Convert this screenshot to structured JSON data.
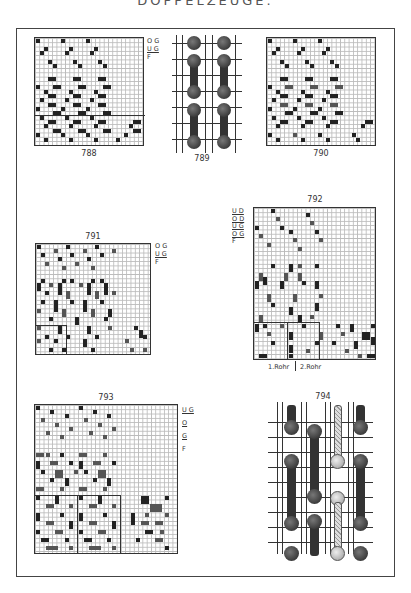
{
  "page": {
    "header": "DOPPELZEUGE."
  },
  "figures": [
    {
      "id": "788",
      "label": "788",
      "type": "weave-draft",
      "legend": [
        "O G",
        "U G",
        "F"
      ]
    },
    {
      "id": "789",
      "label": "789",
      "type": "interlacing-diagram"
    },
    {
      "id": "790",
      "label": "790",
      "type": "weave-draft"
    },
    {
      "id": "791",
      "label": "791",
      "type": "weave-draft",
      "legend": [
        "O G",
        "U G",
        "F"
      ]
    },
    {
      "id": "792",
      "label": "792",
      "type": "weave-draft",
      "legend": [
        "U D",
        "O D",
        "U G",
        "O G",
        "F"
      ],
      "footer": [
        "1.Rohr",
        "2.Rohr"
      ]
    },
    {
      "id": "793",
      "label": "793",
      "type": "weave-draft",
      "legend": [
        "U G",
        "O G",
        "F"
      ]
    },
    {
      "id": "794",
      "label": "794",
      "type": "interlacing-diagram"
    }
  ]
}
